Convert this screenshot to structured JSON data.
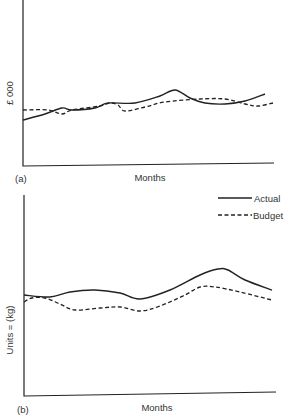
{
  "chart_data": [
    {
      "type": "line",
      "panel": "(a)",
      "title": "",
      "xlabel": "Months",
      "ylabel": "£ 000",
      "grid": false,
      "ticks": false,
      "series": [
        {
          "name": "Actual",
          "style": "solid",
          "points_px": [
            [
              23,
              120
            ],
            [
              45,
              114
            ],
            [
              62,
              108
            ],
            [
              72,
              110
            ],
            [
              95,
              108
            ],
            [
              108,
              103
            ],
            [
              135,
              103
            ],
            [
              160,
              96
            ],
            [
              175,
              90
            ],
            [
              190,
              98
            ],
            [
              205,
              103
            ],
            [
              225,
              104
            ],
            [
              245,
              101
            ],
            [
              265,
              94
            ]
          ]
        },
        {
          "name": "Budget",
          "style": "dashed",
          "points_px": [
            [
              23,
              110
            ],
            [
              48,
              110
            ],
            [
              62,
              114
            ],
            [
              72,
              110
            ],
            [
              100,
              106
            ],
            [
              110,
              103
            ],
            [
              118,
              105
            ],
            [
              125,
              111
            ],
            [
              145,
              107
            ],
            [
              165,
              102
            ],
            [
              200,
              99
            ],
            [
              225,
              99
            ],
            [
              245,
              104
            ],
            [
              258,
              106
            ],
            [
              273,
              103
            ]
          ]
        }
      ]
    },
    {
      "type": "line",
      "panel": "(b)",
      "title": "",
      "xlabel": "Months",
      "ylabel": "Units = (kg)",
      "grid": false,
      "ticks": false,
      "legend": {
        "position": "top-right",
        "entries": [
          "Actual",
          "Budget"
        ]
      },
      "series": [
        {
          "name": "Actual",
          "style": "solid",
          "points_px": [
            [
              24,
              295
            ],
            [
              50,
              297
            ],
            [
              70,
              292
            ],
            [
              95,
              290
            ],
            [
              120,
              293
            ],
            [
              140,
              299
            ],
            [
              170,
              290
            ],
            [
              200,
              275
            ],
            [
              218,
              269
            ],
            [
              228,
              270
            ],
            [
              245,
              280
            ],
            [
              272,
              290
            ]
          ]
        },
        {
          "name": "Budget",
          "style": "dashed",
          "points_px": [
            [
              24,
              302
            ],
            [
              32,
              298
            ],
            [
              45,
              298
            ],
            [
              60,
              304
            ],
            [
              75,
              310
            ],
            [
              100,
              308
            ],
            [
              120,
              307
            ],
            [
              140,
              311
            ],
            [
              160,
              306
            ],
            [
              185,
              295
            ],
            [
              200,
              287
            ],
            [
              215,
              287
            ],
            [
              240,
              292
            ],
            [
              272,
              300
            ]
          ]
        }
      ]
    }
  ],
  "panel_a": {
    "tag": "(a)",
    "xlabel": "Months",
    "ylabel": "£ 000"
  },
  "panel_b": {
    "tag": "(b)",
    "xlabel": "Months",
    "ylabel": "Units = (kg)"
  },
  "legend": {
    "actual": "Actual",
    "budget": "Budget"
  }
}
